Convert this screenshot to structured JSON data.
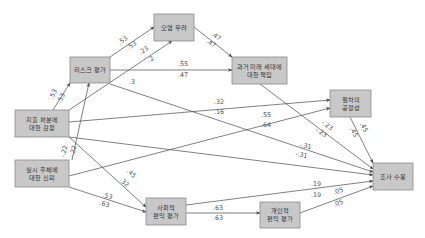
{
  "diagram": {
    "type": "path-diagram",
    "nodes": [
      {
        "id": "risk",
        "lines": [
          "리스크 평가"
        ]
      },
      {
        "id": "contamination",
        "lines": [
          "오염 우려"
        ]
      },
      {
        "id": "responsibility",
        "lines": [
          "과거 미래 세대에",
          "대한 책임"
        ]
      },
      {
        "id": "distributive",
        "lines": [
          "지출 처분에",
          "대한 감정"
        ]
      },
      {
        "id": "trust",
        "lines": [
          "실시 주체에",
          "대한 신뢰"
        ]
      },
      {
        "id": "procedural",
        "lines": [
          "절차의",
          "공정성"
        ]
      },
      {
        "id": "social_benefit",
        "lines": [
          "사회적",
          "편익 평가"
        ]
      },
      {
        "id": "personal_benefit",
        "lines": [
          "개인적",
          "편익 평가"
        ]
      },
      {
        "id": "acceptance",
        "lines": [
          "조사 수용"
        ]
      }
    ],
    "edges": [
      {
        "from": "distributive",
        "to": "risk",
        "coefs": [
          ".53",
          ".53"
        ]
      },
      {
        "from": "trust",
        "to": "risk",
        "coefs": [
          "-.22",
          "-.22"
        ]
      },
      {
        "from": "risk",
        "to": "contamination",
        "coefs": [
          ".53",
          ".53"
        ]
      },
      {
        "from": "distributive",
        "to": "contamination",
        "coefs": [
          ".23",
          ".2"
        ]
      },
      {
        "from": "risk",
        "to": "responsibility",
        "coefs": [
          ".55",
          ".47"
        ]
      },
      {
        "from": "contamination",
        "to": "responsibility",
        "coefs": [
          ".47",
          ".47"
        ]
      },
      {
        "from": "risk",
        "to": "acceptance",
        "coefs": [
          ".3",
          ""
        ]
      },
      {
        "from": "distributive",
        "to": "procedural",
        "coefs": [
          ".32",
          ".16"
        ]
      },
      {
        "from": "trust",
        "to": "procedural",
        "coefs": [
          ".55",
          ".64"
        ]
      },
      {
        "from": "responsibility",
        "to": "acceptance",
        "coefs": [
          "-.23",
          "-.23"
        ]
      },
      {
        "from": "procedural",
        "to": "acceptance",
        "coefs": [
          ".45",
          ".45"
        ]
      },
      {
        "from": "distributive",
        "to": "acceptance",
        "coefs": [
          "-.31",
          "-.31"
        ]
      },
      {
        "from": "distributive",
        "to": "social_benefit",
        "coefs": [
          ".45",
          ".32"
        ]
      },
      {
        "from": "trust",
        "to": "social_benefit",
        "coefs": [
          ".53",
          ".63"
        ]
      },
      {
        "from": "social_benefit",
        "to": "acceptance",
        "coefs": [
          ".19",
          ".19"
        ]
      },
      {
        "from": "social_benefit",
        "to": "personal_benefit",
        "coefs": [
          ".63",
          ".63"
        ]
      },
      {
        "from": "personal_benefit",
        "to": "acceptance",
        "coefs": [
          ".05",
          ".05"
        ]
      }
    ]
  }
}
